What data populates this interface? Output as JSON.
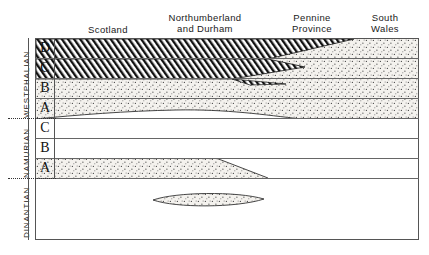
{
  "diagram": {
    "frame": {
      "x": 35,
      "y": 38,
      "width": 384,
      "height": 202
    },
    "colors": {
      "line": "#555555",
      "rule": "#666666",
      "text": "#1a1a1a",
      "stipple_fill": "#f2f0ec",
      "stipple_dot": "#4a4a4a",
      "hatch_line": "#111111",
      "background": "#ffffff"
    }
  },
  "columns": [
    {
      "label": "Scotland",
      "x": 58,
      "y": 24,
      "width": 100
    },
    {
      "label": "Northumberland\nand Durham",
      "x": 150,
      "y": 12,
      "width": 110
    },
    {
      "label": "Pennine\nProvince",
      "x": 272,
      "y": 12,
      "width": 80
    },
    {
      "label": "South\nWales",
      "x": 352,
      "y": 12,
      "width": 66
    }
  ],
  "eras": [
    {
      "name": "WESTPHALIAN",
      "x": 22,
      "y": 118,
      "length": 80
    },
    {
      "name": "NAMURIAN",
      "x": 22,
      "y": 178,
      "length": 60
    },
    {
      "name": "DINANTIAN",
      "x": 22,
      "y": 238,
      "length": 60
    }
  ],
  "stages": [
    {
      "letter": "D",
      "era": "WESTPHALIAN",
      "top": 38,
      "height": 20
    },
    {
      "letter": "C",
      "era": "WESTPHALIAN",
      "top": 58,
      "height": 20
    },
    {
      "letter": "B",
      "era": "WESTPHALIAN",
      "top": 78,
      "height": 20
    },
    {
      "letter": "A",
      "era": "WESTPHALIAN",
      "top": 98,
      "height": 20
    },
    {
      "letter": "C",
      "era": "NAMURIAN",
      "top": 118,
      "height": 20
    },
    {
      "letter": "B",
      "era": "NAMURIAN",
      "top": 138,
      "height": 20
    },
    {
      "letter": "A",
      "era": "NAMURIAN",
      "top": 158,
      "height": 20
    }
  ],
  "rules_y": [
    58,
    78,
    98,
    118,
    138,
    158,
    178
  ],
  "separators": [
    {
      "name": "westphalian-namurian",
      "y": 118,
      "x": 8,
      "width": 48
    },
    {
      "name": "namurian-dinantian",
      "y": 178,
      "x": 8,
      "width": 48
    }
  ],
  "facies": {
    "hatched_D": {
      "name": "coal-measures-hatched-westphalian-d",
      "pattern": "diagonal-hatch",
      "points": "0,0 0,20 232,20 318,0"
    },
    "hatched_C": {
      "name": "coal-measures-hatched-westphalian-c",
      "pattern": "diagonal-hatch",
      "points": "0,0 0,20 196,20 269,8 232,0"
    },
    "hatch_tip_spur": {
      "name": "hatch-tip-spur",
      "points": "232,20 272,24 245,25"
    },
    "stipple_westphalian": {
      "name": "stipple-westphalian-band",
      "description": "stippled sandstone facies filling Westphalian D,C,B,A to the right/below hatched wedges"
    },
    "base_westphalian_curve": {
      "name": "base-westphalian-a-boundary",
      "path": "M0,80 C40,76 90,72 140,71 C190,70 230,76 265,80 C300,83 340,79 382,82"
    },
    "stipple_namurian_a": {
      "name": "stipple-namurian-a-band",
      "points": "0,120 0,139 232,139 180,120"
    },
    "lens_dinantian": {
      "name": "dinantian-limestone-lens",
      "cx": 189,
      "cy": 200,
      "rx": 37,
      "ry": 7
    }
  }
}
